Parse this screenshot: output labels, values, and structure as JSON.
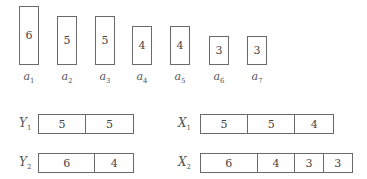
{
  "unit_px": 9.5,
  "items": [
    {
      "name": "a",
      "sub": "1",
      "size": "6",
      "x": 19,
      "top": 6
    },
    {
      "name": "a",
      "sub": "2",
      "size": "5",
      "x": 57,
      "top": 16
    },
    {
      "name": "a",
      "sub": "3",
      "size": "5",
      "x": 95,
      "top": 16
    },
    {
      "name": "a",
      "sub": "4",
      "size": "4",
      "x": 132,
      "top": 26
    },
    {
      "name": "a",
      "sub": "5",
      "size": "4",
      "x": 170,
      "top": 26
    },
    {
      "name": "a",
      "sub": "6",
      "size": "3",
      "x": 209,
      "top": 36
    },
    {
      "name": "a",
      "sub": "7",
      "size": "3",
      "x": 247,
      "top": 36
    }
  ],
  "bins": [
    {
      "name": "Y",
      "sub": "1",
      "label_x": 19,
      "x": 38,
      "y": 114,
      "segments": [
        "5",
        "5"
      ]
    },
    {
      "name": "Y",
      "sub": "2",
      "label_x": 19,
      "x": 38,
      "y": 153,
      "segments": [
        "6",
        "4"
      ]
    },
    {
      "name": "X",
      "sub": "1",
      "label_x": 178,
      "x": 200,
      "y": 114,
      "segments": [
        "5",
        "5",
        "4"
      ]
    },
    {
      "name": "X",
      "sub": "2",
      "label_x": 178,
      "x": 200,
      "y": 153,
      "segments": [
        "6",
        "4",
        "3",
        "3"
      ]
    }
  ]
}
